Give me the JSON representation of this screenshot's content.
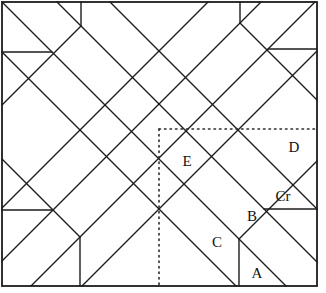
{
  "diagram": {
    "background": "#ffffff",
    "line_color": "#1c1c1c",
    "dotted_color": "#2a2a2a",
    "width": 326,
    "height": 293,
    "border": {
      "x": 2,
      "y": 2,
      "width": 315,
      "height": 284
    },
    "piece_labels": [
      {
        "id": "E",
        "text": "E",
        "x": 187,
        "y": 161
      },
      {
        "id": "D",
        "text": "D",
        "x": 294,
        "y": 147
      },
      {
        "id": "Cr",
        "text": "Cr",
        "x": 283,
        "y": 196
      },
      {
        "id": "B",
        "text": "B",
        "x": 252,
        "y": 216
      },
      {
        "id": "C",
        "text": "C",
        "x": 217,
        "y": 242
      },
      {
        "id": "A",
        "text": "A",
        "x": 257,
        "y": 273
      }
    ],
    "solid_segments": [
      {
        "name": "diag-main-tlbr",
        "x1": 2,
        "y1": 2,
        "x2": 286,
        "y2": 286
      },
      {
        "name": "diag-tlbr-offset-1",
        "x1": 57,
        "y1": 2,
        "x2": 317,
        "y2": 262
      },
      {
        "name": "diag-tlbr-offset-2",
        "x1": 110,
        "y1": 2,
        "x2": 317,
        "y2": 209
      },
      {
        "name": "diag-tlbr-offset-low",
        "x1": 2,
        "y1": 52,
        "x2": 236,
        "y2": 286
      },
      {
        "name": "diag-corner-tr",
        "x1": 240,
        "y1": 23,
        "x2": 317,
        "y2": 100
      },
      {
        "name": "diag-corner-bl",
        "x1": 2,
        "y1": 159,
        "x2": 80,
        "y2": 237
      },
      {
        "name": "diag-main-trbl",
        "x1": 315,
        "y1": 2,
        "x2": 31,
        "y2": 286
      },
      {
        "name": "diag-trbl-offset-1",
        "x1": 261,
        "y1": 2,
        "x2": 2,
        "y2": 261
      },
      {
        "name": "diag-trbl-offset-2",
        "x1": 208,
        "y1": 2,
        "x2": 2,
        "y2": 208
      },
      {
        "name": "diag-trbl-offset-low",
        "x1": 317,
        "y1": 51,
        "x2": 82,
        "y2": 286
      },
      {
        "name": "diag-corner-tl",
        "x1": 81,
        "y1": 26,
        "x2": 2,
        "y2": 105
      },
      {
        "name": "diag-corner-br",
        "x1": 239,
        "y1": 239,
        "x2": 317,
        "y2": 161
      },
      {
        "name": "notch-horizontal-tl",
        "x1": 2,
        "y1": 52,
        "x2": 52,
        "y2": 52
      },
      {
        "name": "notch-horizontal-tr",
        "x1": 268,
        "y1": 49,
        "x2": 317,
        "y2": 49
      },
      {
        "name": "notch-horizontal-br",
        "x1": 264,
        "y1": 209,
        "x2": 317,
        "y2": 209
      },
      {
        "name": "notch-horizontal-bl",
        "x1": 2,
        "y1": 210,
        "x2": 53,
        "y2": 210
      },
      {
        "name": "notch-vertical-tl",
        "x1": 81,
        "y1": 2,
        "x2": 81,
        "y2": 26
      },
      {
        "name": "notch-vertical-tr",
        "x1": 240,
        "y1": 2,
        "x2": 240,
        "y2": 23
      },
      {
        "name": "notch-vertical-br",
        "x1": 239,
        "y1": 239,
        "x2": 239,
        "y2": 286
      },
      {
        "name": "notch-vertical-bl",
        "x1": 80,
        "y1": 237,
        "x2": 80,
        "y2": 286
      }
    ],
    "dotted_segments": [
      {
        "name": "dotted-quadrant-horizontal",
        "x1": 159,
        "y1": 129,
        "x2": 317,
        "y2": 129
      },
      {
        "name": "dotted-quadrant-vertical",
        "x1": 159,
        "y1": 129,
        "x2": 159,
        "y2": 286
      }
    ]
  }
}
